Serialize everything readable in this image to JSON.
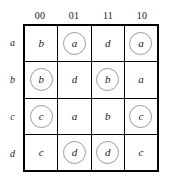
{
  "figure": {
    "name": "karnaugh-map",
    "column_headers": [
      "00",
      "01",
      "11",
      "10"
    ],
    "row_labels": [
      "a",
      "b",
      "c",
      "d"
    ],
    "circle_color": "#9a9a9a",
    "grid_line_color": "#000000",
    "text_color": "#1a1a1a",
    "rows": [
      {
        "label": "a",
        "cells": [
          {
            "value": "b",
            "circled": false
          },
          {
            "value": "a",
            "circled": true
          },
          {
            "value": "d",
            "circled": false
          },
          {
            "value": "a",
            "circled": true
          }
        ]
      },
      {
        "label": "b",
        "cells": [
          {
            "value": "b",
            "circled": true
          },
          {
            "value": "d",
            "circled": false
          },
          {
            "value": "b",
            "circled": true
          },
          {
            "value": "a",
            "circled": false
          }
        ]
      },
      {
        "label": "c",
        "cells": [
          {
            "value": "c",
            "circled": true
          },
          {
            "value": "a",
            "circled": false
          },
          {
            "value": "b",
            "circled": false
          },
          {
            "value": "c",
            "circled": true
          }
        ]
      },
      {
        "label": "d",
        "cells": [
          {
            "value": "c",
            "circled": false
          },
          {
            "value": "d",
            "circled": true
          },
          {
            "value": "d",
            "circled": true
          },
          {
            "value": "c",
            "circled": false
          }
        ]
      }
    ]
  }
}
